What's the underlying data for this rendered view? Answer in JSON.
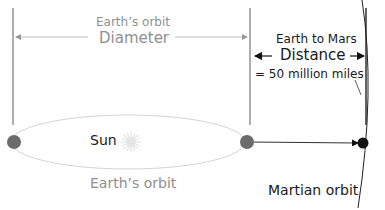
{
  "labels": {
    "earth_orbit_top": "Earth’s orbit",
    "diameter": "Diameter",
    "earth_to_mars": "Earth to Mars",
    "distance": "Distance",
    "distance_value": "= 50 million miles",
    "sun": "Sun",
    "earth_orbit_bottom": "Earth’s orbit",
    "martian_orbit": "Martian orbit"
  },
  "colors": {
    "gray_text": "#8f8f8f",
    "dark_text": "#1a1a1a",
    "earth_dot": "#6b6b6b",
    "mars_dot": "#111111",
    "orbit_line": "#d4d4d4",
    "sun": "#e6e6e6"
  },
  "icons": {
    "sun": "sun-icon"
  }
}
